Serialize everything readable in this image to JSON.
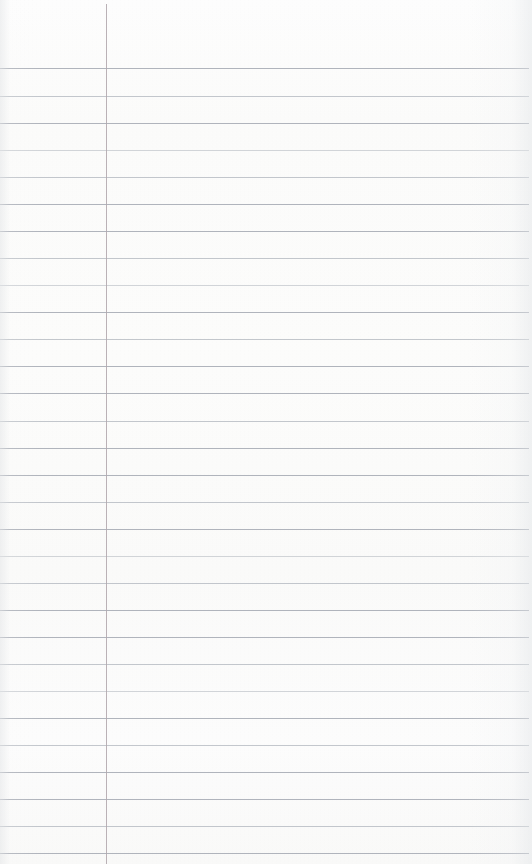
{
  "document": {
    "kind": "ruled-notebook-page",
    "title": "Blank ruled notebook page",
    "page_width": 532,
    "page_height": 864,
    "orientation": "portrait",
    "content_text": "",
    "is_blank": true
  },
  "paper": {
    "background_color": "#fcfcfb",
    "edge_shade_color": "#e4e6e8",
    "texture": "scanned paper grain"
  },
  "ruling": {
    "style": "wide ruled with left margin rule",
    "line_color": "#a9aeb6",
    "line_thickness_px": 1,
    "line_spacing_px": 27.2,
    "first_line_y": 68,
    "line_left_x": 0,
    "line_right_x": 529,
    "header_space_px": 68,
    "line_count": 30,
    "line_y_positions": [
      68,
      96,
      123,
      150,
      177,
      204,
      231,
      258,
      285,
      312,
      339,
      366,
      393,
      421,
      448,
      475,
      502,
      529,
      556,
      583,
      610,
      637,
      664,
      691,
      718,
      745,
      772,
      799,
      826,
      853
    ]
  },
  "margin_rule": {
    "orientation": "vertical",
    "color": "#b2a9ae",
    "thickness_px": 1,
    "x": 106,
    "top_y": 4,
    "bottom_y": 864
  },
  "regions": {
    "header_label": "",
    "margin_column_label": "",
    "writing_area_label": ""
  }
}
